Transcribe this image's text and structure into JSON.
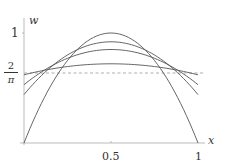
{
  "chart_data": {
    "type": "line",
    "title": "",
    "xlabel": "x",
    "ylabel": "w",
    "xlim": [
      0,
      1
    ],
    "ylim": [
      0,
      1.05
    ],
    "x_ticks": [
      {
        "value": 0.5,
        "label": "0.5"
      },
      {
        "value": 1,
        "label": "1"
      }
    ],
    "y_ticks": [
      {
        "value": 1,
        "label": "1"
      },
      {
        "value": 0.6366,
        "label": "2/π"
      }
    ],
    "grid": false,
    "legend": null,
    "reference_line": {
      "value": 0.6366,
      "label": "2/π",
      "style": "dashed"
    },
    "series": [
      {
        "name": "curve-1",
        "shape": "parabola",
        "w_at_0": 0.0,
        "w_at_half": 1.0,
        "w_at_1": 0.0
      },
      {
        "name": "curve-2",
        "shape": "parabola",
        "w_at_0": 0.44,
        "w_at_half": 0.92,
        "w_at_1": 0.44
      },
      {
        "name": "curve-3",
        "shape": "parabola",
        "w_at_0": 0.53,
        "w_at_half": 0.85,
        "w_at_1": 0.53
      },
      {
        "name": "curve-4",
        "shape": "parabola",
        "w_at_0": 0.62,
        "w_at_half": 0.72,
        "w_at_1": 0.62
      }
    ],
    "annotations": [
      "All curves cross the dashed line 2/π near x≈0.21 and x≈0.79"
    ]
  },
  "labels": {
    "y_axis": "w",
    "x_axis": "x",
    "y_tick_one": "1",
    "y_tick_frac_num": "2",
    "y_tick_frac_den": "π",
    "x_tick_half": "0.5",
    "x_tick_one": "1"
  },
  "colors": {
    "curve": "#555555",
    "axis": "#999999",
    "dashed": "#9a9a9a",
    "text": "#333333"
  }
}
